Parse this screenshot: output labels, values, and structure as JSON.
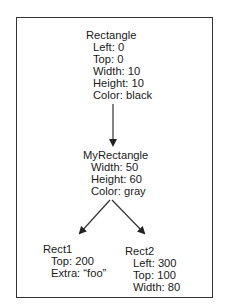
{
  "diagram": {
    "type": "inheritance-tree",
    "nodes": [
      {
        "id": "rectangle",
        "title": "Rectangle",
        "attributes": [
          "Left: 0",
          "Top: 0",
          "Width: 10",
          "Height: 10",
          "Color: black"
        ]
      },
      {
        "id": "myrectangle",
        "title": "MyRectangle",
        "attributes": [
          "Width: 50",
          "Height: 60",
          "Color: gray"
        ]
      },
      {
        "id": "rect1",
        "title": "Rect1",
        "attributes": [
          "Top: 200",
          "Extra: “foo”"
        ]
      },
      {
        "id": "rect2",
        "title": "Rect2",
        "attributes": [
          "Left: 300",
          "Top: 100",
          "Width: 80"
        ]
      }
    ],
    "edges": [
      {
        "from": "rectangle",
        "to": "myrectangle"
      },
      {
        "from": "myrectangle",
        "to": "rect1"
      },
      {
        "from": "myrectangle",
        "to": "rect2"
      }
    ],
    "colors": {
      "line": "#333333",
      "text": "#1a1a1a",
      "background": "#ffffff"
    }
  }
}
